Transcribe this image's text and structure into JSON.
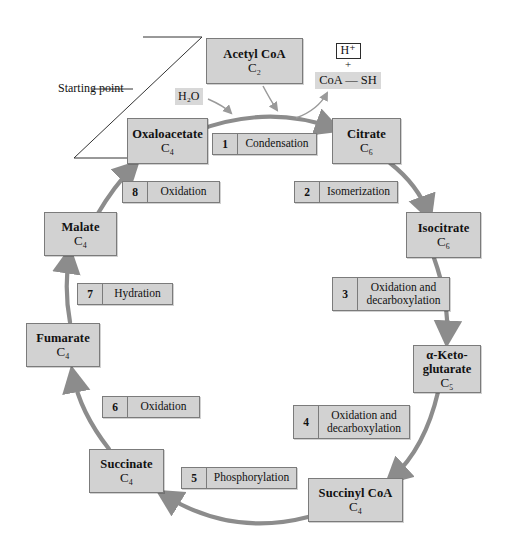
{
  "diagram": {
    "annotation": {
      "starting_point_label": "Starting point"
    },
    "inputs": [
      {
        "id": "water",
        "label": "H₂O"
      }
    ],
    "products": {
      "proton": "H⁺",
      "plus": "+",
      "coenzyme": "CoA — SH"
    },
    "molecules": [
      {
        "id": "acetyl-coa",
        "name": "Acetyl CoA",
        "carbons": "C₂"
      },
      {
        "id": "oxaloacetate",
        "name": "Oxaloacetate",
        "carbons": "C₄"
      },
      {
        "id": "citrate",
        "name": "Citrate",
        "carbons": "C₆"
      },
      {
        "id": "isocitrate",
        "name": "Isocitrate",
        "carbons": "C₆"
      },
      {
        "id": "alpha-ketoglutarate",
        "name": "α-Keto-",
        "name2": "glutarate",
        "carbons": "C₅"
      },
      {
        "id": "succinyl-coa",
        "name": "Succinyl CoA",
        "carbons": "C₄"
      },
      {
        "id": "succinate",
        "name": "Succinate",
        "carbons": "C₄"
      },
      {
        "id": "fumarate",
        "name": "Fumarate",
        "carbons": "C₄"
      },
      {
        "id": "malate",
        "name": "Malate",
        "carbons": "C₄"
      }
    ],
    "steps": [
      {
        "number": "1",
        "label": "Condensation"
      },
      {
        "number": "2",
        "label": "Isomerization"
      },
      {
        "number": "3",
        "label": "Oxidation and decarboxylation"
      },
      {
        "number": "4",
        "label": "Oxidation and decarboxylation"
      },
      {
        "number": "5",
        "label": "Phosphorylation"
      },
      {
        "number": "6",
        "label": "Oxidation"
      },
      {
        "number": "7",
        "label": "Hydration"
      },
      {
        "number": "8",
        "label": "Oxidation"
      }
    ],
    "colors": {
      "box_fill": "#d2d2d2",
      "box_border": "#7b7b7b",
      "arrow": "#8c8c8c",
      "thin_line": "#333333",
      "highlight": "#d8d8d8",
      "background": "#ffffff"
    }
  }
}
